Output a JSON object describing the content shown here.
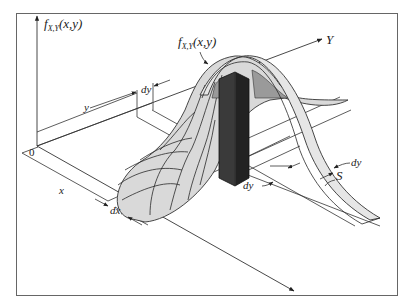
{
  "figure": {
    "labels": {
      "z_axis": {
        "f": "f",
        "sub": "X,Y",
        "args": "(x,y)"
      },
      "surface": {
        "f": "f",
        "sub": "X,Y",
        "args": "(x,y)"
      },
      "y_axis": "Y",
      "origin": "0",
      "x_dist": "x",
      "y_dist": "y",
      "dx": "dx",
      "dy_top": "dy",
      "dy_bottom": "dy",
      "dy_strip": "dy",
      "strip": "S"
    },
    "colors": {
      "frame": "#555555",
      "line": "#333333",
      "surface_fill": "#d9d9d9",
      "strip_fill": "#e6e6e6",
      "column_front": "#3a3a3a",
      "column_side": "#222222",
      "shadow": "#9a9a9a"
    }
  }
}
